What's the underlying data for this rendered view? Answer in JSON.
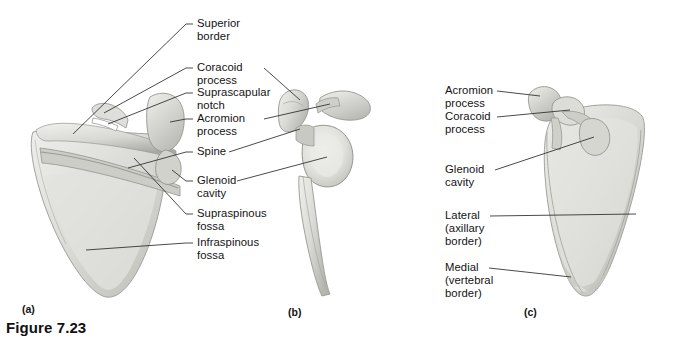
{
  "figure": {
    "caption": "Figure 7.23",
    "background_color": "#ffffff",
    "text_color": "#131313",
    "leader_line_color": "#2b2b2b",
    "bone_light": "#e9e9e6",
    "bone_mid": "#d4d4d0",
    "bone_shadow": "#b3b3ae"
  },
  "panels": [
    {
      "letter": "(a)",
      "view": "posterior-view-scapula"
    },
    {
      "letter": "(b)",
      "view": "lateral-view-scapula"
    },
    {
      "letter": "(c)",
      "view": "anterior-view-scapula"
    }
  ],
  "labels_center": [
    {
      "id": "superior-border",
      "text": "Superior\nborder"
    },
    {
      "id": "coracoid-process",
      "text": "Coracoid\nprocess"
    },
    {
      "id": "suprascapular-notch",
      "text": "Suprascapular\nnotch"
    },
    {
      "id": "acromion-process",
      "text": "Acromion\nprocess"
    },
    {
      "id": "spine",
      "text": "Spine"
    },
    {
      "id": "glenoid-cavity",
      "text": "Glenoid\ncavity"
    },
    {
      "id": "supraspinous-fossa",
      "text": "Supraspinous\nfossa"
    },
    {
      "id": "infraspinous-fossa",
      "text": "Infraspinous\nfossa"
    }
  ],
  "labels_right": [
    {
      "id": "acromion-process-c",
      "text": "Acromion\nprocess"
    },
    {
      "id": "coracoid-process-c",
      "text": "Coracoid\nprocess"
    },
    {
      "id": "glenoid-cavity-c",
      "text": "Glenoid\ncavity"
    },
    {
      "id": "lateral-border-c",
      "text": "Lateral\n(axillary\nborder)"
    },
    {
      "id": "medial-border-c",
      "text": "Medial\n(vertebral\nborder)"
    }
  ]
}
